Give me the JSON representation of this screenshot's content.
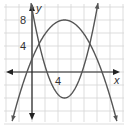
{
  "chart_data": {
    "type": "line",
    "title": "",
    "xlabel": "x",
    "ylabel": "y",
    "x_tick_labels": [
      "4"
    ],
    "y_tick_labels": [
      "4",
      "8"
    ],
    "grid": true,
    "grid_step": 2,
    "xlim": [
      -4,
      15
    ],
    "ylim": [
      -8,
      11
    ],
    "series": [
      {
        "name": "downward parabola",
        "equation": "y = -0.24(x-5)^2 + 8",
        "vertex": [
          5,
          8
        ],
        "x_intercepts": [
          -0.8,
          10.8
        ],
        "color": "#555555"
      },
      {
        "name": "upward parabola",
        "equation": "y = 0.55(x-5)^2 - 4",
        "vertex": [
          5,
          -4
        ],
        "x_intercepts": [
          2.3,
          7.7
        ],
        "color": "#555555"
      }
    ]
  },
  "labels": {
    "x_axis": "x",
    "y_axis": "y",
    "x_tick_4": "4",
    "y_tick_4": "4",
    "y_tick_8": "8"
  }
}
